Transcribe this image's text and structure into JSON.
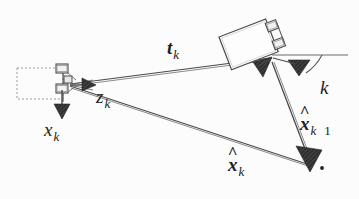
{
  "figure": {
    "background_color": "#fcfcfc",
    "line_color": "#4a4a4a",
    "fill_color": "#3a3a3a",
    "width": 359,
    "height": 199
  },
  "labels": {
    "true_pose": {
      "base": "x",
      "sub": "k",
      "hat": false,
      "bold": false
    },
    "measurement": {
      "base": "z",
      "sub": "k",
      "hat": false,
      "bold": false
    },
    "translation": {
      "base": "t",
      "sub": "k",
      "hat": false,
      "bold": true
    },
    "angle": {
      "base": "k",
      "sub": "",
      "hat": false,
      "bold": false
    },
    "estimate_prior": {
      "base": "x",
      "sub": "k",
      "hat": true,
      "bold": true,
      "suffix": "1"
    },
    "estimate_post": {
      "base": "x",
      "sub": "k",
      "hat": true,
      "bold": true,
      "suffix": ""
    }
  },
  "elements": {
    "dashed_box": "prior-robot-footprint",
    "left_robot": "robot-body-left",
    "right_robot": "robot-body-tilted",
    "reference_line": "horizontal-reference-line",
    "angle_arc": "heading-angle-arc",
    "vertex_dot": "estimate-vertex-dot"
  }
}
